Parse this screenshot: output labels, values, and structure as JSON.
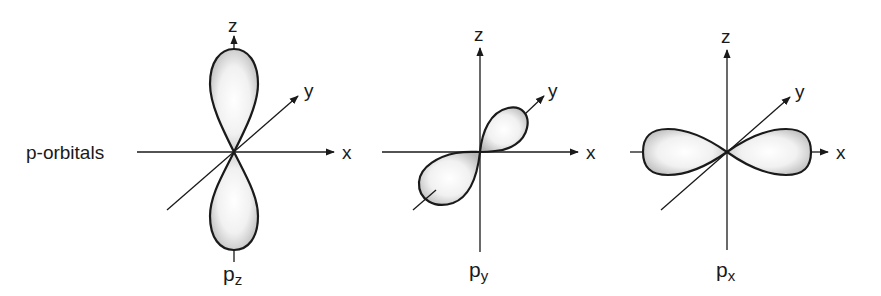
{
  "title": "p-orbitals",
  "colors": {
    "ink": "#1a1a1a",
    "lobe_edge": "#333333",
    "lobe_fill_center": "#ffffff",
    "lobe_fill_edge": "#b8b8b8",
    "background": "#ffffff"
  },
  "axis_labels": {
    "x": "x",
    "y": "y",
    "z": "z"
  },
  "orbitals": [
    {
      "name": "p",
      "subscript": "z",
      "orientation": "vertical along z axis"
    },
    {
      "name": "p",
      "subscript": "y",
      "orientation": "diagonal along y axis"
    },
    {
      "name": "p",
      "subscript": "x",
      "orientation": "horizontal along x axis"
    }
  ]
}
